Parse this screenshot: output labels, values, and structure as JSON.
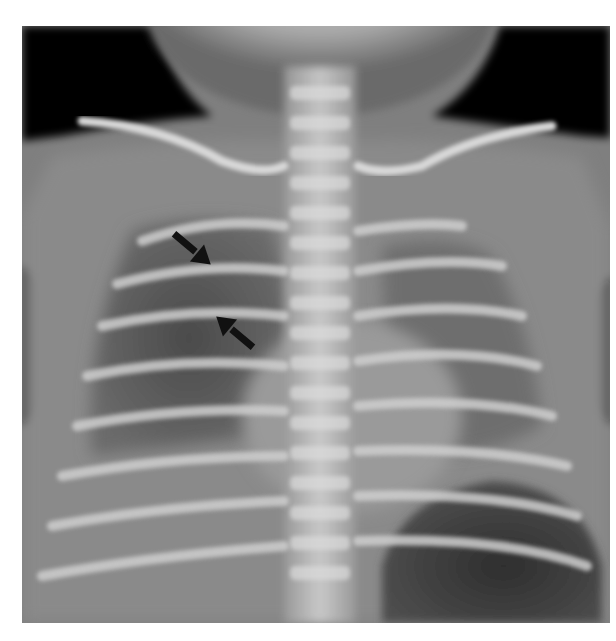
{
  "image": {
    "type": "chest-radiograph",
    "view": "frontal",
    "colors": {
      "background": "#ffffff",
      "film_base": "#7d7d7d",
      "air": "#050505",
      "bone": "#e8e8e8",
      "arrow": "#111111"
    }
  },
  "annotations": {
    "arrows": [
      {
        "name": "upper-arrow",
        "tip_x": 197,
        "tip_y": 253,
        "direction": "down-right"
      },
      {
        "name": "lower-arrow",
        "tip_x": 230,
        "tip_y": 327,
        "direction": "up-left"
      }
    ]
  }
}
